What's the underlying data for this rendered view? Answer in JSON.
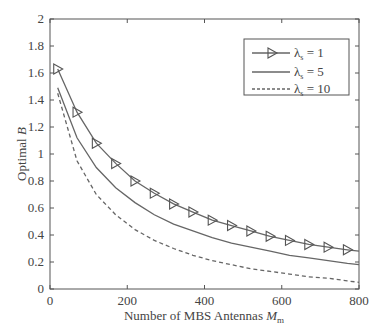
{
  "chart_data": {
    "type": "line",
    "title": "",
    "xlabel": "Number of MBS Antennas M_m",
    "ylabel": "Optimal B",
    "xlim": [
      0,
      800
    ],
    "ylim": [
      0,
      2
    ],
    "xticks": [
      "0",
      "200",
      "400",
      "600",
      "800"
    ],
    "yticks": [
      "0",
      "0.2",
      "0.4",
      "0.6",
      "0.8",
      "1",
      "1.2",
      "1.4",
      "1.6",
      "1.8",
      "2"
    ],
    "grid": false,
    "legend_position": "upper right",
    "x": [
      20,
      70,
      120,
      170,
      220,
      270,
      320,
      370,
      420,
      470,
      520,
      570,
      620,
      670,
      720,
      770,
      800
    ],
    "series": [
      {
        "name": "λs = 1",
        "style": "solid with triangle markers",
        "values": [
          1.63,
          1.31,
          1.08,
          0.93,
          0.8,
          0.71,
          0.63,
          0.57,
          0.51,
          0.47,
          0.43,
          0.39,
          0.36,
          0.33,
          0.31,
          0.29,
          0.28
        ]
      },
      {
        "name": "λs = 5",
        "style": "solid",
        "values": [
          1.49,
          1.12,
          0.9,
          0.75,
          0.64,
          0.55,
          0.48,
          0.43,
          0.38,
          0.34,
          0.31,
          0.28,
          0.25,
          0.23,
          0.21,
          0.19,
          0.18
        ]
      },
      {
        "name": "λs = 10",
        "style": "dashed",
        "values": [
          1.45,
          0.95,
          0.7,
          0.55,
          0.44,
          0.36,
          0.3,
          0.25,
          0.21,
          0.18,
          0.15,
          0.13,
          0.11,
          0.09,
          0.08,
          0.06,
          0.05
        ]
      }
    ]
  },
  "legend": {
    "items": [
      {
        "sym": "λ",
        "sub": "s",
        "rest": " = 1"
      },
      {
        "sym": "λ",
        "sub": "s",
        "rest": " = 5"
      },
      {
        "sym": "λ",
        "sub": "s",
        "rest": " = 10"
      }
    ]
  },
  "axes": {
    "xlabel_main": "Number of MBS Antennas ",
    "xlabel_var": "M",
    "xlabel_sub": "m",
    "ylabel_main": "Optimal ",
    "ylabel_var": "B"
  }
}
